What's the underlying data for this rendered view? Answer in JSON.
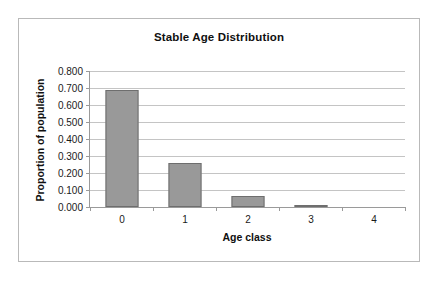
{
  "chart_data": {
    "type": "bar",
    "title": "Stable Age Distribution",
    "xlabel": "Age class",
    "ylabel": "Proportion of population",
    "categories": [
      "0",
      "1",
      "2",
      "3",
      "4"
    ],
    "values": [
      0.689,
      0.257,
      0.064,
      0.008,
      0.0
    ],
    "ylim": [
      0.0,
      0.8
    ],
    "ytick_step": 0.1,
    "ytick_labels": [
      "0.000",
      "0.100",
      "0.200",
      "0.300",
      "0.400",
      "0.500",
      "0.600",
      "0.700",
      "0.800"
    ],
    "ytick_values": [
      0.0,
      0.1,
      0.2,
      0.3,
      0.4,
      0.5,
      0.6,
      0.7,
      0.8
    ],
    "grid": true,
    "legend": false,
    "legend_position": "none",
    "series": [
      {
        "name": "Proportion of population",
        "values": [
          0.689,
          0.257,
          0.064,
          0.008,
          0.0
        ]
      }
    ],
    "colors": {
      "bar_fill": "#999999",
      "bar_border": "#6e6e6e",
      "gridline": "#c4c4c4",
      "axis": "#9a9a9a",
      "frame": "#b9b9b9",
      "plot_background": "#ffffff",
      "text": "#101010"
    }
  }
}
